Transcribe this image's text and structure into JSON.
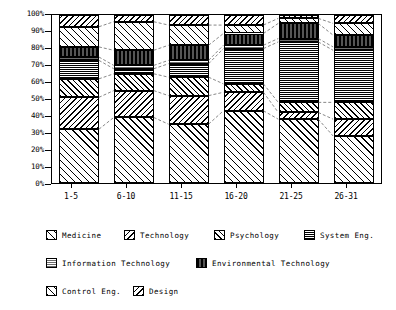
{
  "chart_data": {
    "type": "bar",
    "subtype": "stacked-percentage-bar",
    "title": "",
    "xlabel": "",
    "ylabel": "",
    "ylim": [
      0,
      100
    ],
    "ytick_labels": [
      "100%",
      "90%",
      "80%",
      "70%",
      "60%",
      "50%",
      "40%",
      "30%",
      "20%",
      "10%",
      "0%"
    ],
    "ytick_values": [
      100,
      90,
      80,
      70,
      60,
      50,
      40,
      30,
      20,
      10,
      0
    ],
    "grid": false,
    "legend_position": "below",
    "categories": [
      "1-5",
      "6-10",
      "11-15",
      "16-20",
      "21-25",
      "26-31"
    ],
    "series": [
      {
        "name": "Medicine",
        "pattern": "diagonal-hatch-up-wide",
        "values": [
          32,
          39,
          35,
          43,
          38,
          28
        ]
      },
      {
        "name": "Technology",
        "pattern": "diagonal-hatch-down",
        "values": [
          19,
          16,
          17,
          11,
          4,
          10
        ]
      },
      {
        "name": "Psychology",
        "pattern": "crosshatch-diagonal",
        "values": [
          11,
          10,
          11,
          5,
          6,
          10
        ]
      },
      {
        "name": "System Eng.",
        "pattern": "fine-grid-gray",
        "values": [
          11,
          3,
          8,
          21,
          36,
          31
        ]
      },
      {
        "name": "Information Technology",
        "pattern": "fine-grid-light-gray",
        "values": [
          2,
          2,
          2,
          2,
          2,
          2
        ]
      },
      {
        "name": "Environmental Technology",
        "pattern": "solid-dark-vertical",
        "values": [
          6,
          9,
          9,
          7,
          9,
          7
        ]
      },
      {
        "name": "Control Eng.",
        "pattern": "diagonal-hatch-up-wide",
        "values": [
          12,
          17,
          12,
          5,
          3,
          7
        ]
      },
      {
        "name": "Design",
        "pattern": "diagonal-hatch-down",
        "values": [
          7,
          4,
          6,
          6,
          2,
          5
        ]
      }
    ]
  },
  "axis": {
    "y_ticks": [
      {
        "label": "100%",
        "value": 100
      },
      {
        "label": "90%",
        "value": 90
      },
      {
        "label": "80%",
        "value": 80
      },
      {
        "label": "70%",
        "value": 70
      },
      {
        "label": "60%",
        "value": 60
      },
      {
        "label": "50%",
        "value": 50
      },
      {
        "label": "40%",
        "value": 40
      },
      {
        "label": "30%",
        "value": 30
      },
      {
        "label": "20%",
        "value": 20
      },
      {
        "label": "10%",
        "value": 10
      },
      {
        "label": "0%",
        "value": 0
      }
    ],
    "x_ticks": [
      {
        "label": "1-5"
      },
      {
        "label": "6-10"
      },
      {
        "label": "11-15"
      },
      {
        "label": "16-20"
      },
      {
        "label": "21-25"
      },
      {
        "label": "26-31"
      }
    ]
  },
  "legend": {
    "rows": [
      [
        {
          "label": "Medicine",
          "key": "medicine"
        },
        {
          "label": "Technology",
          "key": "technology"
        },
        {
          "label": "Psychology",
          "key": "psychology"
        },
        {
          "label": "System Eng.",
          "key": "systemeng"
        }
      ],
      [
        {
          "label": "Information Technology",
          "key": "infotech"
        },
        {
          "label": "Environmental Technology",
          "key": "envtech"
        }
      ],
      [
        {
          "label": "Control Eng.",
          "key": "controleng"
        },
        {
          "label": "Design",
          "key": "design"
        }
      ]
    ]
  },
  "colors": {
    "axis": "#000000",
    "background": "#ffffff",
    "connector": "#555555"
  }
}
